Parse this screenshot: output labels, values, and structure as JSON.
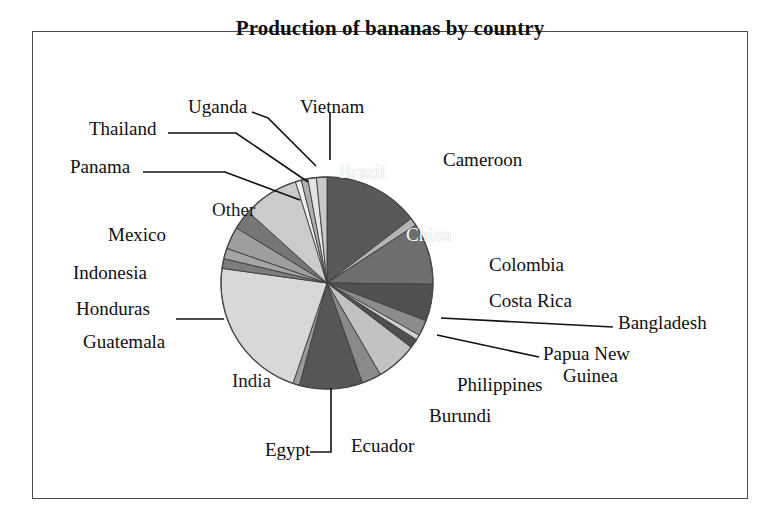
{
  "chart_data": {
    "type": "pie",
    "title": "Production of bananas by country",
    "xlabel": "",
    "ylabel": "",
    "legend": "none",
    "grid": false,
    "units": "share of world production",
    "start_angle_deg": 0,
    "direction": "clockwise",
    "categories": [
      "Brazil",
      "Cameroon",
      "China",
      "Colombia",
      "Costa Rica",
      "Bangladesh",
      "Papua New Guinea",
      "Philippines",
      "Burundi",
      "Ecuador",
      "Egypt",
      "India",
      "Guatemala",
      "Honduras",
      "Indonesia",
      "Mexico",
      "Other",
      "Panama",
      "Thailand",
      "Uganda",
      "Vietnam"
    ],
    "values": [
      14.6,
      1.2,
      9.4,
      5.6,
      2.4,
      0.8,
      1.4,
      6.2,
      3.0,
      9.6,
      1.0,
      22.0,
      1.5,
      1.6,
      3.4,
      3.0,
      8.5,
      0.9,
      1.0,
      1.3,
      1.6
    ],
    "slices": [
      {
        "label": "Brazil",
        "value": 14.6,
        "color": "#595959",
        "label_placement": "inside-white"
      },
      {
        "label": "Cameroon",
        "value": 1.2,
        "color": "#b4b4b4",
        "label_placement": "outside-right"
      },
      {
        "label": "China",
        "value": 9.4,
        "color": "#6e6e6e",
        "label_placement": "inside-white"
      },
      {
        "label": "Colombia",
        "value": 5.6,
        "color": "#515151",
        "label_placement": "outside-right"
      },
      {
        "label": "Costa Rica",
        "value": 2.4,
        "color": "#8c8c8c",
        "label_placement": "outside-right"
      },
      {
        "label": "Bangladesh",
        "value": 0.8,
        "color": "#d0d0d0",
        "label_placement": "outside-leader"
      },
      {
        "label": "Papua New Guinea",
        "value": 1.4,
        "color": "#4f4f4f",
        "label_placement": "outside-leader"
      },
      {
        "label": "Philippines",
        "value": 6.2,
        "color": "#c2c2c2",
        "label_placement": "outside-right"
      },
      {
        "label": "Burundi",
        "value": 3.0,
        "color": "#8a8a8a",
        "label_placement": "outside-bottom"
      },
      {
        "label": "Ecuador",
        "value": 9.6,
        "color": "#565656",
        "label_placement": "outside-bottom"
      },
      {
        "label": "Egypt",
        "value": 1.0,
        "color": "#9a9a9a",
        "label_placement": "outside-leader"
      },
      {
        "label": "India",
        "value": 22.0,
        "color": "#d8d8d8",
        "label_placement": "inside-dark"
      },
      {
        "label": "Guatemala",
        "value": 1.5,
        "color": "#7c7c7c",
        "label_placement": "outside-left"
      },
      {
        "label": "Honduras",
        "value": 1.6,
        "color": "#a5a5a5",
        "label_placement": "outside-leader"
      },
      {
        "label": "Indonesia",
        "value": 3.4,
        "color": "#9e9e9e",
        "label_placement": "outside-left"
      },
      {
        "label": "Mexico",
        "value": 3.0,
        "color": "#767676",
        "label_placement": "outside-left"
      },
      {
        "label": "Other",
        "value": 8.5,
        "color": "#cbcbcb",
        "label_placement": "inside-dark"
      },
      {
        "label": "Panama",
        "value": 0.9,
        "color": "#efefef",
        "label_placement": "outside-leader"
      },
      {
        "label": "Thailand",
        "value": 1.0,
        "color": "#b0b0b0",
        "label_placement": "outside-leader"
      },
      {
        "label": "Uganda",
        "value": 1.3,
        "color": "#e4e4e4",
        "label_placement": "outside-leader"
      },
      {
        "label": "Vietnam",
        "value": 1.6,
        "color": "#c8c8c8",
        "label_placement": "outside-leader"
      }
    ]
  },
  "labels": {
    "brazil": "Brazil",
    "cameroon": "Cameroon",
    "china": "China",
    "colombia": "Colombia",
    "costa_rica": "Costa Rica",
    "bangladesh": "Bangladesh",
    "papua_new_guinea_line1": "Papua New",
    "papua_new_guinea_line2": "Guinea",
    "philippines": "Philippines",
    "burundi": "Burundi",
    "ecuador": "Ecuador",
    "egypt": "Egypt",
    "india": "India",
    "guatemala": "Guatemala",
    "honduras": "Honduras",
    "indonesia": "Indonesia",
    "mexico": "Mexico",
    "other": "Other",
    "panama": "Panama",
    "thailand": "Thailand",
    "uganda": "Uganda",
    "vietnam": "Vietnam"
  },
  "style": {
    "outline_color": "#4a4a4a",
    "slice_edge_color": "#3d3d3d",
    "text_color": "#101010",
    "inside_light_text": "#ffffff",
    "background": "#ffffff"
  }
}
